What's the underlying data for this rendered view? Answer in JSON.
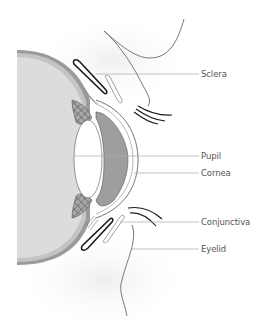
{
  "diagram": {
    "labels": [
      {
        "id": "sclera",
        "text": "Sclera",
        "y": 74,
        "line_x1": 96,
        "line_x2": 199
      },
      {
        "id": "pupil",
        "text": "Pupil",
        "y": 156,
        "line_x1": 74,
        "line_x2": 199
      },
      {
        "id": "cornea",
        "text": "Cornea",
        "y": 173,
        "line_x1": 134,
        "line_x2": 199
      },
      {
        "id": "conjunctiva",
        "text": "Conjunctiva",
        "y": 222,
        "line_x1": 120,
        "line_x2": 199
      },
      {
        "id": "eyelid",
        "text": "Eyelid",
        "y": 249,
        "line_x1": 132,
        "line_x2": 199
      }
    ],
    "colors": {
      "globe_fill": "#dcdcdc",
      "sclera_band": "#9a9a9a",
      "iris_fill": "#9e9e9e",
      "lens_fill": "#ffffff",
      "outline": "#555555",
      "eyelid_dark": "#1a1a1a",
      "leader_line": "#aaaaaa",
      "label_text": "#555555",
      "skin_shadow": "#f2f2f2"
    }
  }
}
